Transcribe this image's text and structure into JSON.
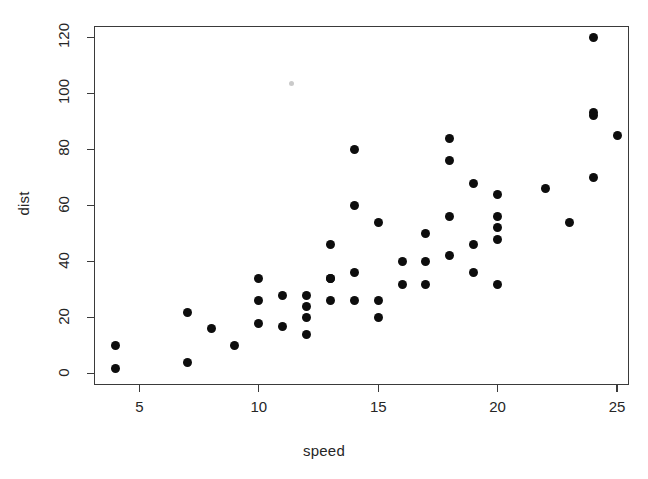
{
  "figure": {
    "background_color": "#ffffff",
    "point_color": "#0d0d0d",
    "axis_color": "#3a3a3a",
    "artifact_label": "scan-speck"
  },
  "chart_data": {
    "type": "scatter",
    "title": "",
    "xlabel": "speed",
    "ylabel": "dist",
    "xlim": [
      3.1,
      25.5
    ],
    "ylim": [
      -4,
      124
    ],
    "grid": false,
    "legend": null,
    "xticks": [
      5,
      10,
      15,
      20,
      25
    ],
    "yticks": [
      0,
      20,
      40,
      60,
      80,
      100,
      120
    ],
    "xtick_labels": [
      "5",
      "10",
      "15",
      "20",
      "25"
    ],
    "ytick_labels": [
      "0",
      "20",
      "40",
      "60",
      "80",
      "100",
      "120"
    ],
    "n_points": 50,
    "x": [
      4,
      4,
      7,
      7,
      8,
      9,
      10,
      10,
      10,
      11,
      11,
      12,
      12,
      12,
      12,
      13,
      13,
      13,
      13,
      14,
      14,
      14,
      14,
      15,
      15,
      15,
      16,
      16,
      17,
      17,
      17,
      18,
      18,
      18,
      18,
      19,
      19,
      19,
      20,
      20,
      20,
      20,
      20,
      22,
      23,
      24,
      24,
      24,
      24,
      25
    ],
    "y": [
      2,
      10,
      4,
      22,
      16,
      10,
      18,
      26,
      34,
      17,
      28,
      14,
      20,
      24,
      28,
      26,
      34,
      34,
      46,
      26,
      36,
      60,
      80,
      20,
      26,
      54,
      32,
      40,
      32,
      40,
      50,
      42,
      56,
      76,
      84,
      36,
      46,
      68,
      32,
      48,
      52,
      56,
      64,
      66,
      54,
      70,
      92,
      93,
      120,
      85
    ],
    "series": [
      {
        "name": "cars",
        "points": [
          {
            "speed": 4,
            "dist": 2
          },
          {
            "speed": 4,
            "dist": 10
          },
          {
            "speed": 7,
            "dist": 4
          },
          {
            "speed": 7,
            "dist": 22
          },
          {
            "speed": 8,
            "dist": 16
          },
          {
            "speed": 9,
            "dist": 10
          },
          {
            "speed": 10,
            "dist": 18
          },
          {
            "speed": 10,
            "dist": 26
          },
          {
            "speed": 10,
            "dist": 34
          },
          {
            "speed": 11,
            "dist": 17
          },
          {
            "speed": 11,
            "dist": 28
          },
          {
            "speed": 12,
            "dist": 14
          },
          {
            "speed": 12,
            "dist": 20
          },
          {
            "speed": 12,
            "dist": 24
          },
          {
            "speed": 12,
            "dist": 28
          },
          {
            "speed": 13,
            "dist": 26
          },
          {
            "speed": 13,
            "dist": 34
          },
          {
            "speed": 13,
            "dist": 34
          },
          {
            "speed": 13,
            "dist": 46
          },
          {
            "speed": 14,
            "dist": 26
          },
          {
            "speed": 14,
            "dist": 36
          },
          {
            "speed": 14,
            "dist": 60
          },
          {
            "speed": 14,
            "dist": 80
          },
          {
            "speed": 15,
            "dist": 20
          },
          {
            "speed": 15,
            "dist": 26
          },
          {
            "speed": 15,
            "dist": 54
          },
          {
            "speed": 16,
            "dist": 32
          },
          {
            "speed": 16,
            "dist": 40
          },
          {
            "speed": 17,
            "dist": 32
          },
          {
            "speed": 17,
            "dist": 40
          },
          {
            "speed": 17,
            "dist": 50
          },
          {
            "speed": 18,
            "dist": 42
          },
          {
            "speed": 18,
            "dist": 56
          },
          {
            "speed": 18,
            "dist": 76
          },
          {
            "speed": 18,
            "dist": 84
          },
          {
            "speed": 19,
            "dist": 36
          },
          {
            "speed": 19,
            "dist": 46
          },
          {
            "speed": 19,
            "dist": 68
          },
          {
            "speed": 20,
            "dist": 32
          },
          {
            "speed": 20,
            "dist": 48
          },
          {
            "speed": 20,
            "dist": 52
          },
          {
            "speed": 20,
            "dist": 56
          },
          {
            "speed": 20,
            "dist": 64
          },
          {
            "speed": 22,
            "dist": 66
          },
          {
            "speed": 23,
            "dist": 54
          },
          {
            "speed": 24,
            "dist": 70
          },
          {
            "speed": 24,
            "dist": 92
          },
          {
            "speed": 24,
            "dist": 93
          },
          {
            "speed": 24,
            "dist": 120
          },
          {
            "speed": 25,
            "dist": 85
          }
        ]
      }
    ]
  }
}
